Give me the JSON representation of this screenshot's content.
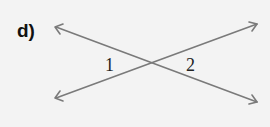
{
  "problem": {
    "label": "d)"
  },
  "figure": {
    "type": "intersecting-lines",
    "line_color": "#7a7a7a",
    "background": "#f3f3f3",
    "intersection": [
      154,
      64
    ],
    "lines": [
      {
        "name": "line-a",
        "from": [
          55,
          27
        ],
        "to": [
          257,
          102
        ],
        "arrows": "both"
      },
      {
        "name": "line-b",
        "from": [
          55,
          98
        ],
        "to": [
          257,
          24
        ],
        "arrows": "both"
      }
    ],
    "angles": [
      {
        "label": "1",
        "x": 105,
        "y": 71
      },
      {
        "label": "2",
        "x": 186,
        "y": 71
      }
    ]
  }
}
